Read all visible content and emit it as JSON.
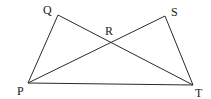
{
  "diagram": {
    "type": "geometry",
    "points": {
      "P": {
        "label": "P",
        "x": 28,
        "y": 83,
        "label_x": 17,
        "label_y": 95
      },
      "Q": {
        "label": "Q",
        "x": 58,
        "y": 15,
        "label_x": 43,
        "label_y": 14
      },
      "R": {
        "label": "R",
        "x": 110,
        "y": 42,
        "label_x": 105,
        "label_y": 35
      },
      "S": {
        "label": "S",
        "x": 165,
        "y": 16,
        "label_x": 171,
        "label_y": 16
      },
      "T": {
        "label": "T",
        "x": 193,
        "y": 85,
        "label_x": 195,
        "label_y": 97
      }
    },
    "segments": [
      {
        "name": "PQ",
        "from": "P",
        "to": "Q"
      },
      {
        "name": "QT",
        "from": "Q",
        "to": "T"
      },
      {
        "name": "PS",
        "from": "P",
        "to": "S"
      },
      {
        "name": "ST",
        "from": "S",
        "to": "T"
      },
      {
        "name": "PT",
        "from": "P",
        "to": "T"
      }
    ],
    "line_color": "#2a2a2a",
    "label_color": "#1a1a1a"
  }
}
